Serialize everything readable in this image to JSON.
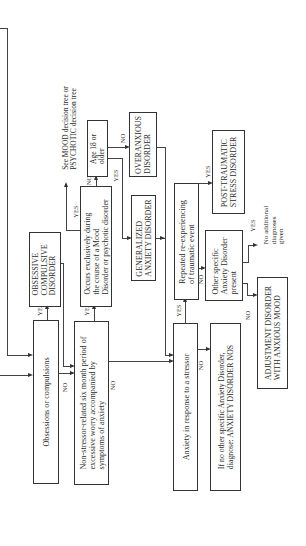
{
  "nodes": {
    "obsessions": "Obsessions or compulsions",
    "ocd": "OBSESSIVE\nCOMPULSIVE\nDISORDER",
    "nonstressor": "Non-stressor-related six month period of\nexcessive worry accompanied by\nsymptoms of anxiety",
    "occurs": "Occurs exclusively during\nthe course of a Mood\nDisorder or psychotic disorder",
    "see_mood": "See MOOD decision tree or\nPSYCHOTIC decision tree",
    "age": "Age 18 or\nolder",
    "overanxious": "OVERANXIOUS\nDISORDER",
    "gad": "GENERALIZED\nANXIETY DISORDER",
    "stressor": "Anxiety in response to a stressor",
    "reexp": "Repeated re-experiencing\nof traumatic event",
    "ptsd": "POST-TRAUMATIC\nSTRESS DISORDER",
    "other_specific": "Other specific\nAnxiety Disorder\npresent",
    "no_additional": "No additional\ndiagnoses\ngiven",
    "adjustment": "ADJUSTMENT DISORDER\nWITH ANXIOUS MOOD",
    "nos": "If no other specific Anxiety Disorder,\ndiagnose: ANXIETY DISORDER NOS"
  },
  "labels": {
    "yes": "YES",
    "no": "NO"
  }
}
